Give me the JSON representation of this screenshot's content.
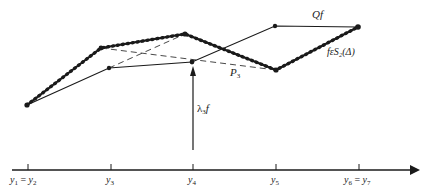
{
  "figure": {
    "labels": {
      "Qf": "Qf",
      "spline": "fεS₂(Δ)",
      "P3": "P",
      "P3_sub": "3",
      "lambda": "λ",
      "lambda_sub": "3",
      "lambda_f": "f"
    },
    "axis": {
      "ticks": [
        {
          "label": "y",
          "sub": "1",
          "eq": " = ",
          "label2": "y",
          "sub2": "2",
          "x": 28
        },
        {
          "label": "y",
          "sub": "3",
          "x": 111
        },
        {
          "label": "y",
          "sub": "4",
          "x": 193
        },
        {
          "label": "y",
          "sub": "5",
          "x": 276
        },
        {
          "label": "y",
          "sub": "6",
          "eq": " = ",
          "label2": "y",
          "sub2": "7",
          "x": 359
        }
      ]
    },
    "curves": {
      "spline_f": [
        [
          27,
          105
        ],
        [
          101,
          48
        ],
        [
          185,
          34
        ],
        [
          276,
          70
        ],
        [
          358,
          27
        ]
      ],
      "Qf": [
        [
          27,
          105
        ],
        [
          109,
          68
        ],
        [
          192,
          62
        ],
        [
          275,
          26
        ],
        [
          358,
          27
        ]
      ],
      "dashed_1": [
        [
          101,
          48
        ],
        [
          276,
          70
        ]
      ],
      "dashed_2": [
        [
          109,
          68
        ],
        [
          185,
          34
        ]
      ]
    }
  }
}
